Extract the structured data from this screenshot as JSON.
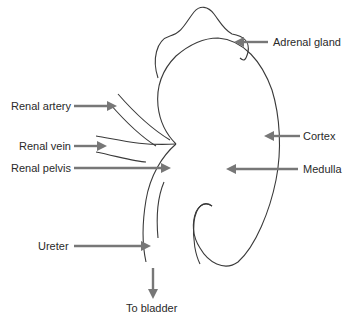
{
  "diagram": {
    "labels": {
      "adrenal_gland": "Adrenal gland",
      "renal_artery": "Renal artery",
      "renal_vein": "Renal vein",
      "cortex": "Cortex",
      "renal_pelvis": "Renal pelvis",
      "medulla": "Medulla",
      "ureter": "Ureter",
      "to_bladder": "To bladder"
    },
    "colors": {
      "outline": "#3a3a3a",
      "arrow": "#777777",
      "text": "#2a2a2a",
      "background": "#ffffff"
    }
  }
}
